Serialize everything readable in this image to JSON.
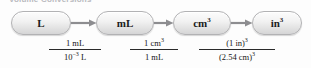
{
  "diagram": {
    "title_fragment": "Volume Conversions",
    "type": "unit-conversion-flow",
    "steps": [
      {
        "id": "L",
        "label": "L",
        "exponent": ""
      },
      {
        "id": "mL",
        "label": "mL",
        "exponent": ""
      },
      {
        "id": "cm3",
        "label": "cm",
        "exponent": "3"
      },
      {
        "id": "in3",
        "label": "in",
        "exponent": "3"
      }
    ],
    "conversions": [
      {
        "from": "L",
        "to": "mL",
        "numerator": "1 mL",
        "denominator_base": "10",
        "denominator_exponent": "−3",
        "denominator_unit": " L"
      },
      {
        "from": "mL",
        "to": "cm3",
        "numerator_base": "1 cm",
        "numerator_exponent": "3",
        "denominator": "1 mL"
      },
      {
        "from": "cm3",
        "to": "in3",
        "numerator_base": "(1 in)",
        "numerator_exponent": "3",
        "denominator_base": "(2.54 cm)",
        "denominator_exponent": "3"
      }
    ],
    "colors": {
      "background": "#fdfdfd",
      "box_border": "#b2b2b4",
      "box_fill_top": "#fcfcfc",
      "box_fill_bottom": "#d5d5d6",
      "arrow": "#8d8d90",
      "text": "#1b1b1b",
      "rule": "#2a2a2a"
    }
  }
}
